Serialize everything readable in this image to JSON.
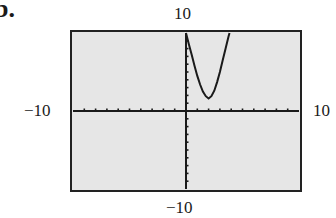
{
  "part_label": "b.",
  "chart_data": {
    "type": "line",
    "title": "",
    "xlabel": "",
    "ylabel": "",
    "xlim": [
      -10,
      10
    ],
    "ylim": [
      -10,
      10
    ],
    "xscale_tick": 1,
    "yscale_tick": 1,
    "grid": false,
    "legend": "none",
    "window_labels": {
      "ymax": "10",
      "ymin": "−10",
      "xmin": "−10",
      "xmax": "10"
    },
    "series": [
      {
        "name": "f(x)",
        "x": [
          0,
          0.25,
          0.5,
          0.75,
          1.0,
          1.25,
          1.5,
          1.75,
          2.0,
          2.25,
          2.5,
          2.75,
          3.0,
          3.25,
          3.5,
          3.75,
          3.85
        ],
        "y": [
          10,
          8.6,
          7.2,
          5.8,
          4.5,
          3.4,
          2.5,
          1.9,
          1.6,
          1.9,
          2.6,
          3.7,
          5.0,
          6.5,
          8.0,
          9.5,
          10
        ]
      }
    ],
    "colors": {
      "screen_bg": "#e6e6e6",
      "curve": "#1a1a1a",
      "axes": "#1a1a1a",
      "frame": "#222222"
    }
  }
}
